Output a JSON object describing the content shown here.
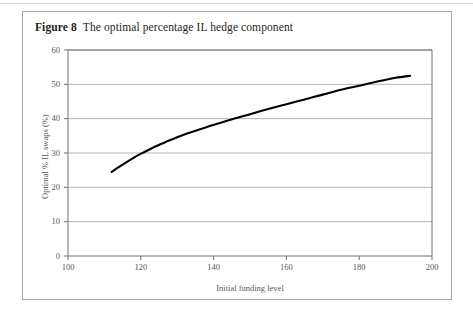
{
  "figure": {
    "label": "Figure 8",
    "caption": "The optimal percentage IL hedge component"
  },
  "chart_data": {
    "type": "line",
    "title": "The optimal percentage IL hedge component",
    "xlabel": "Initial funding level",
    "ylabel": "Optimal % IL swaps (%)",
    "xlim": [
      100,
      200
    ],
    "ylim": [
      0,
      60
    ],
    "xticks": [
      100,
      120,
      140,
      160,
      180,
      200
    ],
    "yticks": [
      0,
      10,
      20,
      30,
      40,
      50,
      60
    ],
    "xtick_labels": [
      "100",
      "120",
      "140",
      "160",
      "180",
      "200"
    ],
    "ytick_labels": [
      "0",
      "10",
      "20",
      "30",
      "40",
      "50",
      "60"
    ],
    "grid": "horizontal",
    "legend": null,
    "series": [
      {
        "name": "Optimal % IL swaps",
        "color": "#000000",
        "x": [
          112,
          115,
          118,
          121,
          124,
          127,
          130,
          134,
          138,
          142,
          146,
          150,
          155,
          160,
          165,
          170,
          175,
          180,
          185,
          190,
          194
        ],
        "y": [
          24.5,
          26.6,
          28.6,
          30.3,
          31.9,
          33.3,
          34.6,
          36.1,
          37.5,
          38.8,
          40.1,
          41.3,
          42.8,
          44.2,
          45.6,
          47.0,
          48.4,
          49.6,
          50.8,
          51.9,
          52.5
        ]
      }
    ]
  }
}
